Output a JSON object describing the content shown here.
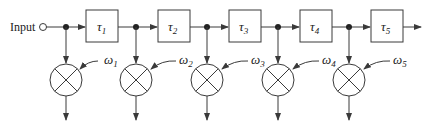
{
  "diagram": {
    "type": "tapped-delay-line beamformer",
    "input_label": "Input",
    "stages": [
      {
        "delay": "τ",
        "delay_sub": "1",
        "weight": "ω",
        "weight_sub": "1"
      },
      {
        "delay": "τ",
        "delay_sub": "2",
        "weight": "ω",
        "weight_sub": "2"
      },
      {
        "delay": "τ",
        "delay_sub": "3",
        "weight": "ω",
        "weight_sub": "3"
      },
      {
        "delay": "τ",
        "delay_sub": "4",
        "weight": "ω",
        "weight_sub": "4"
      },
      {
        "delay": "τ",
        "delay_sub": "5",
        "weight": "ω",
        "weight_sub": "5"
      }
    ],
    "colors": {
      "line": "#3a3a3a",
      "dot": "#222222",
      "background": "#ffffff"
    }
  }
}
